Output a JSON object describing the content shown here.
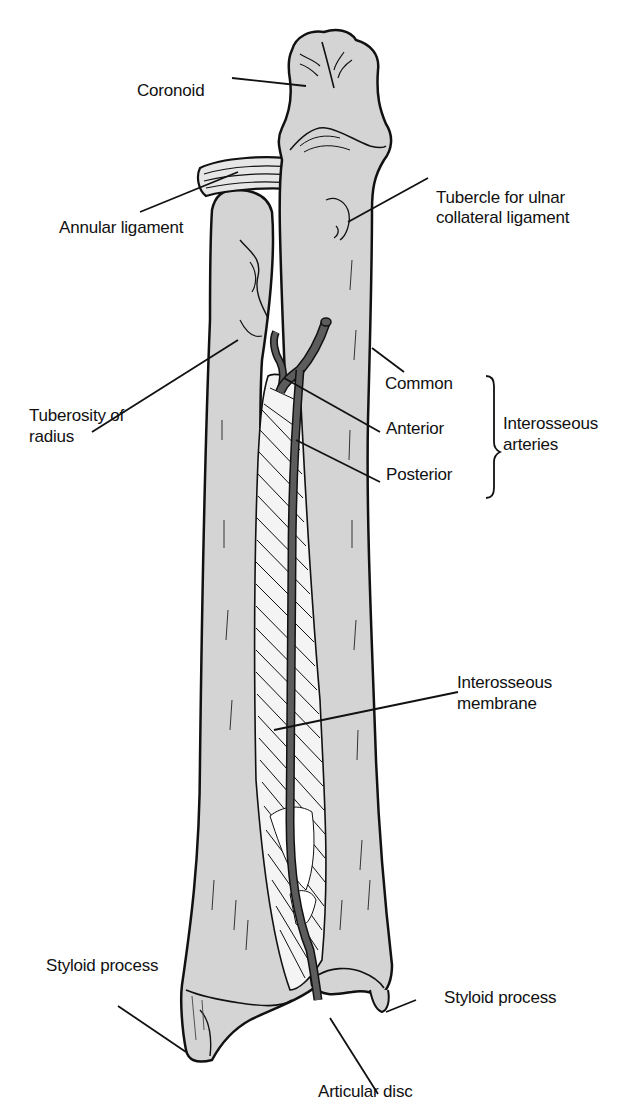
{
  "figure": {
    "colors": {
      "background": "#ffffff",
      "bone_fill": "#d4d4d4",
      "outline": "#111111",
      "artery": "#5c5c5c",
      "membrane_fill": "#f4f4f4",
      "text": "#111111"
    }
  },
  "labels": {
    "coronoid": "Coronoid",
    "tubercle_line1": "Tubercle for ulnar",
    "tubercle_line2": "collateral ligament",
    "annular_ligament": "Annular ligament",
    "tuberosity_line1": "Tuberosity of",
    "tuberosity_line2": "radius",
    "common": "Common",
    "anterior": "Anterior",
    "posterior": "Posterior",
    "interosseous_arteries_line1": "Interosseous",
    "interosseous_arteries_line2": "arteries",
    "membrane_line1": "Interosseous",
    "membrane_line2": "membrane",
    "styloid_left": "Styloid process",
    "styloid_right": "Styloid process",
    "articular_disc": "Articular disc"
  }
}
